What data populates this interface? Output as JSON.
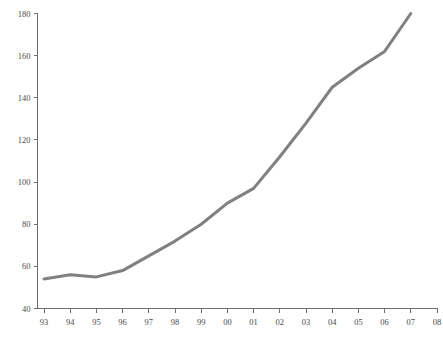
{
  "chart_data": {
    "type": "line",
    "title": "",
    "subtitle": "",
    "xlabel": "",
    "ylabel": "",
    "x": [
      "93",
      "94",
      "95",
      "96",
      "97",
      "98",
      "99",
      "00",
      "01",
      "02",
      "03",
      "04",
      "05",
      "06",
      "07"
    ],
    "categories": [
      "93",
      "94",
      "95",
      "96",
      "97",
      "98",
      "99",
      "00",
      "01",
      "02",
      "03",
      "04",
      "05",
      "06",
      "07"
    ],
    "values": [
      54,
      56,
      55,
      58,
      65,
      72,
      80,
      90,
      97,
      112,
      128,
      145,
      154,
      162,
      180
    ],
    "series": [
      {
        "name": "",
        "values": [
          54,
          56,
          55,
          58,
          65,
          72,
          80,
          90,
          97,
          112,
          128,
          145,
          154,
          162,
          180
        ]
      }
    ],
    "xlim": [
      "93",
      "08"
    ],
    "ylim": [
      40,
      180
    ],
    "ytick_labels": [
      "40",
      "60",
      "80",
      "100",
      "120",
      "140",
      "160",
      "180"
    ],
    "ytick_values": [
      40,
      60,
      80,
      100,
      120,
      140,
      160,
      180
    ],
    "xtick_labels": [
      "93",
      "94",
      "95",
      "96",
      "97",
      "98",
      "99",
      "00",
      "01",
      "02",
      "03",
      "04",
      "05",
      "06",
      "07",
      "08"
    ],
    "grid": false,
    "legend": null,
    "legend_position": "none",
    "annotations": [],
    "line_color": "#808080",
    "axis_color": "#6e6e6e",
    "label_color": "#4a4a4a",
    "background_color": "#ffffff"
  }
}
